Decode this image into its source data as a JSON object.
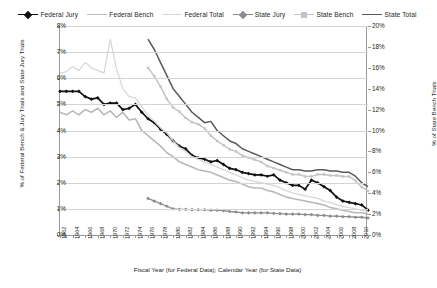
{
  "legend": {
    "position": "top-center",
    "items": [
      {
        "label": "Federal Jury",
        "color": "#111111",
        "marker": "diamond",
        "width": 1.7
      },
      {
        "label": "Federal Bench",
        "color": "#b9b9b9",
        "marker": "none",
        "width": 1.6
      },
      {
        "label": "Federal Total",
        "color": "#d8d8d8",
        "marker": "none",
        "width": 1.3
      },
      {
        "label": "State Jury",
        "color": "#8b8b8b",
        "marker": "diamond",
        "width": 1.3
      },
      {
        "label": "State Bench",
        "color": "#c4c4c4",
        "marker": "square",
        "width": 1.5
      },
      {
        "label": "State Total",
        "color": "#5a5a5a",
        "marker": "none",
        "width": 1.5
      }
    ]
  },
  "axes": {
    "left": {
      "title": "% of Federal Bench & Jury Trials and State Jury Trials",
      "ticks": [
        "0%",
        "1%",
        "2%",
        "3%",
        "4%",
        "5%",
        "6%",
        "7%",
        "8%"
      ],
      "min": 0,
      "max": 8
    },
    "right": {
      "title": "% of State Bench Trials",
      "ticks": [
        "0%",
        "2%",
        "4%",
        "6%",
        "8%",
        "10%",
        "12%",
        "14%",
        "16%",
        "18%",
        "20%"
      ],
      "min": 0,
      "max": 20
    },
    "x": {
      "title": "Fiscal Year (for Federal Data); Calendar Year (for State Data)",
      "labels": [
        "1962",
        "1964",
        "1966",
        "1968",
        "1970",
        "1972",
        "1974",
        "1976",
        "1978",
        "1980",
        "1982",
        "1984",
        "1986",
        "1988",
        "1990",
        "1992",
        "1994",
        "1996",
        "1998",
        "2000",
        "2002",
        "2004",
        "2006",
        "2008",
        "2010"
      ],
      "min": 1962,
      "max": 2011
    }
  },
  "chart_data": {
    "type": "line",
    "title": "",
    "xlabel": "Fiscal Year (for Federal Data); Calendar Year (for State Data)",
    "ylabel": "% of Federal Bench & Jury Trials and State Jury Trials",
    "ylabel_right": "% of State Bench Trials",
    "xlim": [
      1962,
      2011
    ],
    "ylim": [
      0,
      8
    ],
    "ylim_right": [
      0,
      20
    ],
    "grid": true,
    "legend_position": "top-center",
    "series": [
      {
        "name": "Federal Jury",
        "axis": "left",
        "color": "#111111",
        "x": [
          1962,
          1963,
          1964,
          1965,
          1966,
          1967,
          1968,
          1969,
          1970,
          1971,
          1972,
          1973,
          1974,
          1975,
          1976,
          1977,
          1978,
          1979,
          1980,
          1981,
          1982,
          1983,
          1984,
          1985,
          1986,
          1987,
          1988,
          1989,
          1990,
          1991,
          1992,
          1993,
          1994,
          1995,
          1996,
          1997,
          1998,
          1999,
          2000,
          2001,
          2002,
          2003,
          2004,
          2005,
          2006,
          2007,
          2008,
          2009,
          2010,
          2011
        ],
        "values": [
          5.5,
          5.5,
          5.5,
          5.5,
          5.3,
          5.2,
          5.25,
          5.0,
          5.05,
          5.05,
          4.8,
          4.85,
          5.0,
          4.7,
          4.45,
          4.3,
          4.05,
          3.85,
          3.6,
          3.4,
          3.3,
          3.05,
          2.95,
          2.9,
          2.8,
          2.85,
          2.7,
          2.55,
          2.5,
          2.4,
          2.35,
          2.3,
          2.3,
          2.25,
          2.3,
          2.1,
          2.0,
          1.9,
          1.9,
          1.75,
          2.1,
          2.0,
          1.85,
          1.7,
          1.45,
          1.3,
          1.25,
          1.2,
          1.15,
          0.95
        ]
      },
      {
        "name": "Federal Bench",
        "axis": "left",
        "color": "#b9b9b9",
        "x": [
          1962,
          1963,
          1964,
          1965,
          1966,
          1967,
          1968,
          1969,
          1970,
          1971,
          1972,
          1973,
          1974,
          1975,
          1976,
          1977,
          1978,
          1979,
          1980,
          1981,
          1982,
          1983,
          1984,
          1985,
          1986,
          1987,
          1988,
          1989,
          1990,
          1991,
          1992,
          1993,
          1994,
          1995,
          1996,
          1997,
          1998,
          1999,
          2000,
          2001,
          2002,
          2003,
          2004,
          2005,
          2006,
          2007,
          2008,
          2009,
          2010,
          2011
        ],
        "values": [
          4.7,
          4.6,
          4.75,
          4.6,
          4.8,
          4.7,
          4.85,
          4.6,
          4.75,
          4.5,
          4.7,
          4.4,
          4.45,
          4.0,
          3.8,
          3.6,
          3.4,
          3.15,
          3.0,
          2.8,
          2.7,
          2.6,
          2.5,
          2.45,
          2.4,
          2.3,
          2.2,
          2.1,
          2.05,
          1.95,
          1.85,
          1.8,
          1.8,
          1.7,
          1.65,
          1.55,
          1.45,
          1.4,
          1.35,
          1.3,
          1.25,
          1.2,
          1.15,
          1.05,
          1.0,
          0.95,
          0.9,
          0.85,
          0.85,
          0.8
        ]
      },
      {
        "name": "Federal Total",
        "axis": "left",
        "color": "#d8d8d8",
        "x": [
          1962,
          1963,
          1964,
          1965,
          1966,
          1967,
          1968,
          1969,
          1970,
          1971,
          1972,
          1973,
          1974,
          1975,
          1976,
          1977,
          1978,
          1979,
          1980,
          1981,
          1982,
          1983,
          1984,
          1985,
          1986,
          1987,
          1988,
          1989,
          1990,
          1991,
          1992,
          1993,
          1994,
          1995,
          1996,
          1997,
          1998,
          1999,
          2000,
          2001,
          2002,
          2003,
          2004,
          2005,
          2006,
          2007,
          2008,
          2009,
          2010,
          2011
        ],
        "values": [
          6.2,
          6.25,
          6.45,
          6.3,
          6.6,
          6.4,
          6.3,
          6.2,
          7.5,
          6.35,
          5.6,
          5.3,
          5.25,
          4.9,
          4.6,
          4.35,
          4.1,
          3.9,
          3.6,
          3.35,
          3.2,
          3.0,
          2.9,
          2.8,
          2.7,
          2.6,
          2.5,
          2.4,
          2.3,
          2.2,
          2.1,
          2.05,
          2.0,
          1.95,
          1.9,
          1.8,
          1.7,
          1.6,
          1.55,
          1.5,
          1.45,
          1.4,
          1.3,
          1.25,
          1.15,
          1.1,
          1.05,
          1.0,
          0.95,
          0.9
        ]
      },
      {
        "name": "State Jury",
        "axis": "left",
        "color": "#8b8b8b",
        "x": [
          1976,
          1977,
          1978,
          1979,
          1980,
          1981,
          1982,
          1983,
          1984,
          1985,
          1986,
          1987,
          1988,
          1989,
          1990,
          1991,
          1992,
          1993,
          1994,
          1995,
          1996,
          1997,
          1998,
          1999,
          2000,
          2001,
          2002,
          2003,
          2004,
          2005,
          2006,
          2007,
          2008,
          2009,
          2010,
          2011
        ],
        "values": [
          1.4,
          1.3,
          1.2,
          1.1,
          1.0,
          0.98,
          0.98,
          0.97,
          0.97,
          0.97,
          0.95,
          0.95,
          0.93,
          0.9,
          0.88,
          0.85,
          0.85,
          0.85,
          0.85,
          0.85,
          0.83,
          0.82,
          0.8,
          0.8,
          0.8,
          0.78,
          0.78,
          0.75,
          0.75,
          0.72,
          0.72,
          0.7,
          0.7,
          0.68,
          0.68,
          0.65
        ]
      },
      {
        "name": "State Bench",
        "axis": "right",
        "color": "#c4c4c4",
        "x": [
          1976,
          1977,
          1978,
          1979,
          1980,
          1981,
          1982,
          1983,
          1984,
          1985,
          1986,
          1987,
          1988,
          1989,
          1990,
          1991,
          1992,
          1993,
          1994,
          1995,
          1996,
          1997,
          1998,
          1999,
          2000,
          2001,
          2002,
          2003,
          2004,
          2005,
          2006,
          2007,
          2008,
          2009,
          2010,
          2011
        ],
        "values": [
          16.0,
          15.2,
          14.2,
          13.0,
          12.2,
          11.8,
          11.2,
          10.8,
          10.6,
          10.2,
          9.5,
          9.0,
          8.6,
          8.2,
          8.0,
          7.6,
          7.4,
          7.2,
          7.0,
          6.6,
          6.4,
          6.2,
          6.0,
          5.8,
          5.8,
          5.6,
          5.6,
          5.8,
          5.8,
          5.7,
          5.7,
          5.6,
          5.6,
          5.2,
          4.6,
          4.2
        ]
      },
      {
        "name": "State Total",
        "axis": "left",
        "color": "#5a5a5a",
        "x": [
          1976,
          1977,
          1978,
          1979,
          1980,
          1981,
          1982,
          1983,
          1984,
          1985,
          1986,
          1987,
          1988,
          1989,
          1990,
          1991,
          1992,
          1993,
          1994,
          1995,
          1996,
          1997,
          1998,
          1999,
          2000,
          2001,
          2002,
          2003,
          2004,
          2005,
          2006,
          2007,
          2008,
          2009,
          2010,
          2011
        ],
        "values": [
          7.5,
          7.1,
          6.6,
          6.1,
          5.6,
          5.3,
          5.0,
          4.7,
          4.5,
          4.3,
          4.35,
          4.0,
          3.8,
          3.6,
          3.5,
          3.3,
          3.2,
          3.1,
          3.0,
          2.9,
          2.8,
          2.7,
          2.6,
          2.5,
          2.5,
          2.45,
          2.45,
          2.5,
          2.5,
          2.45,
          2.45,
          2.4,
          2.4,
          2.25,
          2.0,
          1.85
        ]
      }
    ]
  }
}
